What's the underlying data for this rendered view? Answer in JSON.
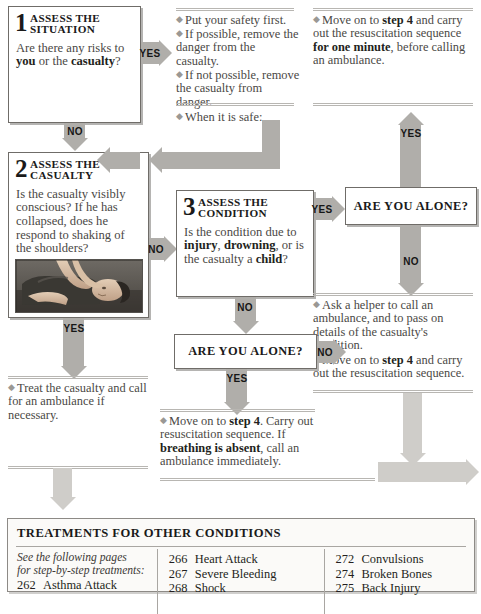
{
  "flowchart": {
    "title": "Emergency action flowchart",
    "steps": [
      {
        "number": "1",
        "title": "ASSESS THE SITUATION",
        "question_plain": "Are there any risks to ",
        "question_bold1": "you",
        "question_mid": " or the ",
        "question_bold2": "casualty",
        "question_end": "?"
      },
      {
        "number": "2",
        "title": "ASSESS THE CASUALTY",
        "question": "Is the casualty visibly conscious? If he has collapsed, does he respond to shaking of the shoulders?"
      },
      {
        "number": "3",
        "title": "ASSESS THE CONDITION",
        "q_a": "Is the condition due to ",
        "q_b1": "injury",
        "q_c": ", ",
        "q_b2": "drowning",
        "q_d": ", or is the casualty a ",
        "q_b3": "child",
        "q_e": "?"
      }
    ],
    "decisions": [
      {
        "id": "alone-right",
        "label": "ARE YOU ALONE?"
      },
      {
        "id": "alone-mid",
        "label": "ARE YOU ALONE?"
      }
    ],
    "arrow_labels": {
      "step1_yes": "YES",
      "step1_no": "NO",
      "step2_no": "NO",
      "step2_yes": "YES",
      "step3_yes": "YES",
      "step3_no": "NO",
      "alone_right_yes": "YES",
      "alone_right_no": "NO",
      "alone_mid_yes": "YES",
      "alone_mid_no": "NO"
    },
    "notes": {
      "safety": {
        "b1": "Put your safety first.",
        "b2": "If possible, remove the danger from the casualty.",
        "b3": "If not possible, remove the casualty from danger.",
        "b4": "When it is safe:"
      },
      "one_minute": {
        "a": "Move on to ",
        "b1": "step 4",
        "c": " and carry out the resuscitation sequence ",
        "b2": "for one minute",
        "d": ", before calling an ambulance."
      },
      "helper": {
        "b1": "Ask a helper to call an ambulance, and to pass on details of the casualty's condition.",
        "b2_a": "Move on to ",
        "b2_b": "step 4",
        "b2_c": " and carry out the resuscitation sequence."
      },
      "treat": {
        "b1": "Treat the casualty and call for an ambulance if necessary."
      },
      "breathing": {
        "a": "Move on to ",
        "b1": "step 4",
        "c": ". Carry out resuscitation sequence. If ",
        "b2": "breathing is absent",
        "d": ", call an ambulance immediately."
      }
    },
    "photo_alt": "Rescuer shaking the shoulders of a casualty lying on the ground"
  },
  "treatments_panel": {
    "title": "TREATMENTS FOR OTHER CONDITIONS",
    "lead_line1": "See the following pages",
    "lead_line2": "for step-by-step treatments:",
    "columns": [
      {
        "entries": [
          {
            "page": "262",
            "name": "Asthma Attack"
          }
        ]
      },
      {
        "entries": [
          {
            "page": "266",
            "name": "Heart Attack"
          },
          {
            "page": "267",
            "name": "Severe Bleeding"
          },
          {
            "page": "268",
            "name": "Shock"
          }
        ]
      },
      {
        "entries": [
          {
            "page": "272",
            "name": "Convulsions"
          },
          {
            "page": "274",
            "name": "Broken Bones"
          },
          {
            "page": "275",
            "name": "Back Injury"
          }
        ]
      }
    ]
  },
  "colors": {
    "arrow_grey": "#b0aeaa",
    "arrow_light": "#cfcdc9",
    "box_border": "#6f6c68",
    "text": "#231f20",
    "body_text": "#4a4845"
  }
}
